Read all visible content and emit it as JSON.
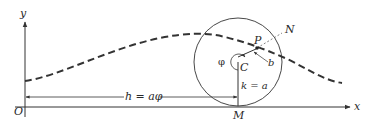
{
  "diagram": {
    "type": "geometry-figure",
    "colors": {
      "line": "#333333",
      "curve": "#333333",
      "background": "#ffffff"
    },
    "axes": {
      "x_label": "x",
      "y_label": "y",
      "origin_label": "O"
    },
    "circle": {
      "center_label": "C",
      "contact_point_label": "M",
      "point_label": "P",
      "rim_point_label": "N",
      "radius_label": "k = a",
      "distance_label": "b",
      "angle_label": "φ"
    },
    "translation": {
      "label": "h = aφ"
    },
    "curve": {
      "style": "dashed",
      "description": "Traced path of point P"
    }
  }
}
